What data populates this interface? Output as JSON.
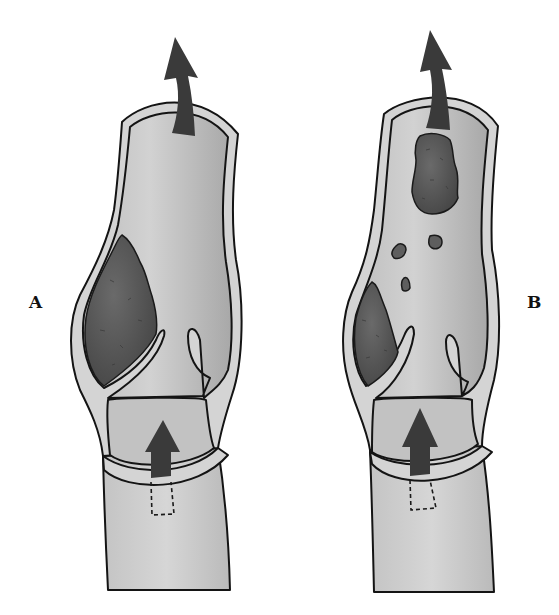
{
  "figure": {
    "labels": [
      {
        "id": "A",
        "text": "A",
        "x": 29,
        "y": 292
      },
      {
        "id": "B",
        "text": "B",
        "x": 527,
        "y": 292
      }
    ],
    "colors": {
      "background": "#ffffff",
      "vein_wall": "#d4d4d4",
      "lumen_light": "#cdcdcd",
      "lumen_dark": "#a9a9a9",
      "thrombus": "#5a5a5a",
      "thrombus_dark": "#4a4a4a",
      "arrow": "#3a3a3a",
      "outline": "#141414"
    },
    "panels": [
      {
        "id": "A",
        "description": "Vein with thrombus attached near valve cusp; blood flow arrows upward",
        "elements": [
          "vein-wall",
          "upper-lumen",
          "valve-sinus",
          "lower-chamber",
          "valve-ring",
          "thrombus",
          "flow-arrow-top",
          "flow-arrow-bottom",
          "dashed-outline"
        ]
      },
      {
        "id": "B",
        "description": "Vein with thrombus fragments detached (embolus) traveling upward",
        "elements": [
          "vein-wall",
          "upper-lumen",
          "valve-sinus",
          "lower-chamber",
          "valve-ring",
          "residual-thrombus",
          "embolus",
          "fragments",
          "flow-arrow-top",
          "flow-arrow-bottom",
          "dashed-outline"
        ]
      }
    ]
  }
}
